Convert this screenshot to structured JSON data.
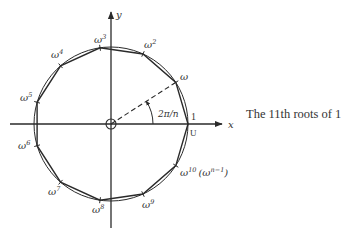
{
  "diagram": {
    "type": "unit-circle-roots-of-unity",
    "n": 11,
    "center": [
      111,
      124
    ],
    "radius": 77,
    "axes": {
      "x_label": "x",
      "y_label": "y",
      "x_range": [
        10,
        222
      ],
      "y_range": [
        12,
        228
      ]
    },
    "angle_label": "2π/n",
    "unit_labels": {
      "one": "1",
      "U": "U"
    },
    "vertices": [
      {
        "k": 0,
        "label": "",
        "label_pos": [
          0,
          0
        ]
      },
      {
        "k": 1,
        "label": "ω",
        "sup": "",
        "label_pos": [
          180,
          80
        ]
      },
      {
        "k": 2,
        "label": "ω",
        "sup": "2",
        "label_pos": [
          144,
          48
        ]
      },
      {
        "k": 3,
        "label": "ω",
        "sup": "3",
        "label_pos": [
          94,
          43
        ]
      },
      {
        "k": 4,
        "label": "ω",
        "sup": "4",
        "label_pos": [
          51,
          58
        ]
      },
      {
        "k": 5,
        "label": "ω",
        "sup": "5",
        "label_pos": [
          20,
          101
        ]
      },
      {
        "k": 6,
        "label": "ω",
        "sup": "6",
        "label_pos": [
          18,
          149
        ]
      },
      {
        "k": 7,
        "label": "ω",
        "sup": "7",
        "label_pos": [
          48,
          195
        ]
      },
      {
        "k": 8,
        "label": "ω",
        "sup": "8",
        "label_pos": [
          92,
          213
        ]
      },
      {
        "k": 9,
        "label": "ω",
        "sup": "9",
        "label_pos": [
          142,
          208
        ]
      },
      {
        "k": 10,
        "label": "ω",
        "sup": "10",
        "extra": "(ω",
        "extra_sup": "n−1",
        "extra_close": ")",
        "label_pos": [
          180,
          176
        ]
      }
    ]
  },
  "caption": "The 11th roots of 1",
  "colors": {
    "stroke": "#2a2a2a",
    "text": "#333333",
    "background": "#ffffff"
  }
}
